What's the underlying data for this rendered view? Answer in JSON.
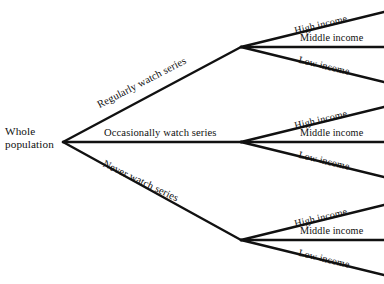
{
  "diagram": {
    "type": "tree-diagram",
    "title": "",
    "background_color": "#ffffff",
    "line_color": "#111111",
    "text_color": "#101010",
    "root": {
      "label_line1": "Whole",
      "label_line2": "population"
    },
    "branches": [
      {
        "id": "regularly",
        "label": "Regularly watch series",
        "orientation": "up",
        "leaves": [
          {
            "id": "regularly-high",
            "label": "High income",
            "orientation": "up"
          },
          {
            "id": "regularly-middle",
            "label": "Middle income",
            "orientation": "flat"
          },
          {
            "id": "regularly-low",
            "label": "Low income",
            "orientation": "down"
          }
        ]
      },
      {
        "id": "occasionally",
        "label": "Occasionally watch series",
        "orientation": "flat",
        "leaves": [
          {
            "id": "occasionally-high",
            "label": "High income",
            "orientation": "up"
          },
          {
            "id": "occasionally-middle",
            "label": "Middle income",
            "orientation": "flat"
          },
          {
            "id": "occasionally-low",
            "label": "Low income",
            "orientation": "down"
          }
        ]
      },
      {
        "id": "never",
        "label": "Never watch series",
        "orientation": "down",
        "leaves": [
          {
            "id": "never-high",
            "label": "High income",
            "orientation": "up"
          },
          {
            "id": "never-middle",
            "label": "Middle income",
            "orientation": "flat"
          },
          {
            "id": "never-low",
            "label": "Low income",
            "orientation": "down"
          }
        ]
      }
    ]
  }
}
